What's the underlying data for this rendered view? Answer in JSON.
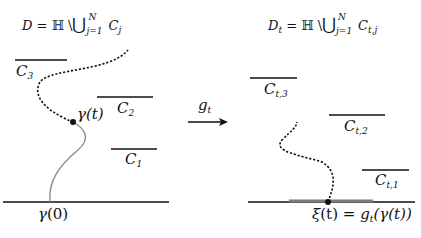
{
  "diagram": {
    "left_domain": {
      "title": {
        "lhs": "D",
        "eq": "=",
        "set": "ℍ",
        "minus": "\\",
        "union": "⋃",
        "union_upper": "N",
        "union_lower": "j=1",
        "term": "C",
        "term_sub": "j"
      },
      "slits": [
        {
          "name": "C",
          "sub": "3"
        },
        {
          "name": "C",
          "sub": "2"
        },
        {
          "name": "C",
          "sub": "1"
        }
      ],
      "curve_tip_label": {
        "fn": "γ",
        "arg": "(t)"
      },
      "curve_start_label": {
        "fn": "γ",
        "arg": "(0)"
      }
    },
    "map_arrow": {
      "label": "g",
      "label_sub": "t"
    },
    "right_domain": {
      "title": {
        "lhs": "D",
        "lhs_sub": "t",
        "eq": "=",
        "set": "ℍ",
        "minus": "\\",
        "union": "⋃",
        "union_upper": "N",
        "union_lower": "j=1",
        "term": "C",
        "term_sub": "t,j"
      },
      "slits": [
        {
          "name": "C",
          "sub": "t,3"
        },
        {
          "name": "C",
          "sub": "t,2"
        },
        {
          "name": "C",
          "sub": "t,1"
        }
      ],
      "driving_label": {
        "lhs": "ξ",
        "lhs_arg": "(t)",
        "eq": "=",
        "fn": "g",
        "fn_sub": "t",
        "arg": "(γ(t))"
      }
    },
    "colors": {
      "line": "#111111",
      "trace_gray": "#8a8a8a",
      "segment_gray": "#7a7a7a"
    }
  }
}
